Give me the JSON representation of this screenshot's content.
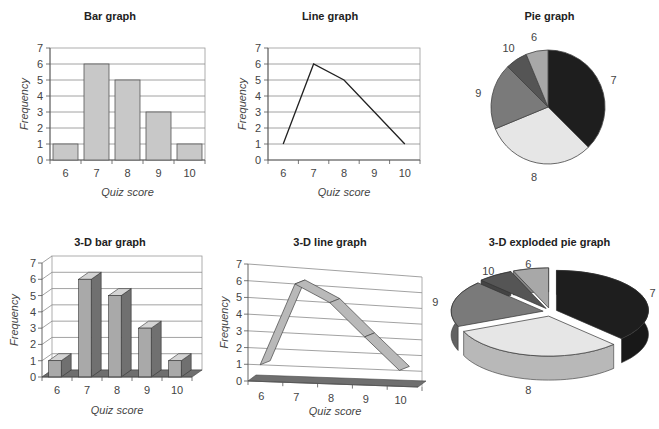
{
  "panels": {
    "bar": {
      "title": "Bar graph",
      "xlabel": "Quiz score",
      "ylabel": "Frequency"
    },
    "line": {
      "title": "Line graph",
      "xlabel": "Quiz score",
      "ylabel": "Frequency"
    },
    "pie": {
      "title": "Pie graph"
    },
    "bar3d": {
      "title": "3-D bar graph",
      "xlabel": "Quiz score",
      "ylabel": "Frequency"
    },
    "line3d": {
      "title": "3-D line graph",
      "xlabel": "Quiz score",
      "ylabel": "Frequency"
    },
    "pie3d": {
      "title": "3-D exploded pie graph"
    }
  },
  "colors": {
    "bar_fill": "#c8c8c8",
    "bar3d_front": "#a9a9a9",
    "bar3d_side": "#707070",
    "bar3d_top": "#d4d4d4",
    "floor": "#6f6f6f",
    "grid": "#8a8a8a",
    "pie": {
      "6": "#a8a8a8",
      "7": "#1e1e1e",
      "8": "#e6e6e6",
      "9": "#7a7a7a",
      "10": "#555555"
    }
  },
  "chart_data": [
    {
      "type": "bar",
      "title": "Bar graph",
      "categories": [
        "6",
        "7",
        "8",
        "9",
        "10"
      ],
      "values": [
        1,
        6,
        5,
        3,
        1
      ],
      "xlabel": "Quiz score",
      "ylabel": "Frequency",
      "ylim": [
        0,
        7
      ],
      "yticks": [
        0,
        1,
        2,
        3,
        4,
        5,
        6,
        7
      ],
      "grid": true
    },
    {
      "type": "line",
      "title": "Line graph",
      "categories": [
        "6",
        "7",
        "8",
        "9",
        "10"
      ],
      "values": [
        1,
        6,
        5,
        3,
        1
      ],
      "xlabel": "Quiz score",
      "ylabel": "Frequency",
      "ylim": [
        0,
        7
      ],
      "yticks": [
        0,
        1,
        2,
        3,
        4,
        5,
        6,
        7
      ],
      "grid": true
    },
    {
      "type": "pie",
      "title": "Pie graph",
      "labels": [
        "7",
        "8",
        "9",
        "10",
        "6"
      ],
      "values": [
        6,
        5,
        3,
        1,
        1
      ]
    },
    {
      "type": "bar",
      "title": "3-D bar graph",
      "categories": [
        "6",
        "7",
        "8",
        "9",
        "10"
      ],
      "values": [
        1,
        6,
        5,
        3,
        1
      ],
      "xlabel": "Quiz score",
      "ylabel": "Frequency",
      "ylim": [
        0,
        7
      ],
      "yticks": [
        0,
        1,
        2,
        3,
        4,
        5,
        6,
        7
      ],
      "grid": true,
      "style": "3d"
    },
    {
      "type": "line",
      "title": "3-D line graph",
      "categories": [
        "6",
        "7",
        "8",
        "9",
        "10"
      ],
      "values": [
        1,
        6,
        5,
        3,
        1
      ],
      "xlabel": "Quiz score",
      "ylabel": "Frequency",
      "ylim": [
        0,
        7
      ],
      "yticks": [
        0,
        1,
        2,
        3,
        4,
        5,
        6,
        7
      ],
      "grid": true,
      "style": "3d"
    },
    {
      "type": "pie",
      "title": "3-D exploded pie graph",
      "labels": [
        "7",
        "8",
        "9",
        "10",
        "6"
      ],
      "values": [
        6,
        5,
        3,
        1,
        1
      ],
      "style": "3d-exploded"
    }
  ]
}
